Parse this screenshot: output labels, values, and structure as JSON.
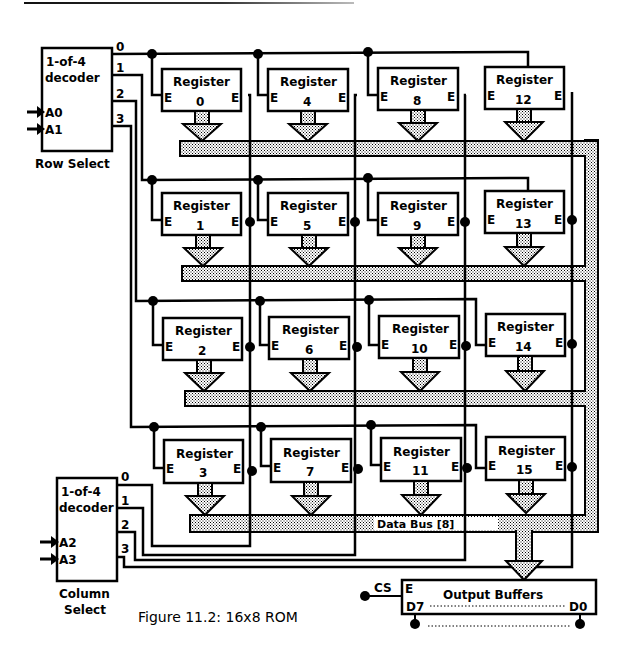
{
  "figure": {
    "caption": "Figure 11.2: 16x8 ROM"
  },
  "row_decoder": {
    "title_line1": "1-of-4",
    "title_line2": "decoder",
    "inputs": [
      "A0",
      "A1"
    ],
    "outputs": [
      "0",
      "1",
      "2",
      "3"
    ],
    "label": "Row Select"
  },
  "column_decoder": {
    "title_line1": "1-of-4",
    "title_line2": "decoder",
    "inputs": [
      "A2",
      "A3"
    ],
    "outputs": [
      "0",
      "1",
      "2",
      "3"
    ],
    "label_line1": "Column",
    "label_line2": "Select"
  },
  "registers": {
    "label": "Register",
    "enable_label": "E",
    "numbers": [
      "0",
      "4",
      "8",
      "12",
      "1",
      "5",
      "9",
      "13",
      "2",
      "6",
      "10",
      "14",
      "3",
      "7",
      "11",
      "15"
    ]
  },
  "data_bus": {
    "label": "Data Bus [8]"
  },
  "output_buffers": {
    "label": "Output Buffers",
    "enable_label": "E",
    "chip_select": "CS",
    "msb": "D7",
    "lsb": "D0"
  },
  "colors": {
    "line": "#000000",
    "background": "#ffffff",
    "stipple": "#9a9a9a"
  }
}
